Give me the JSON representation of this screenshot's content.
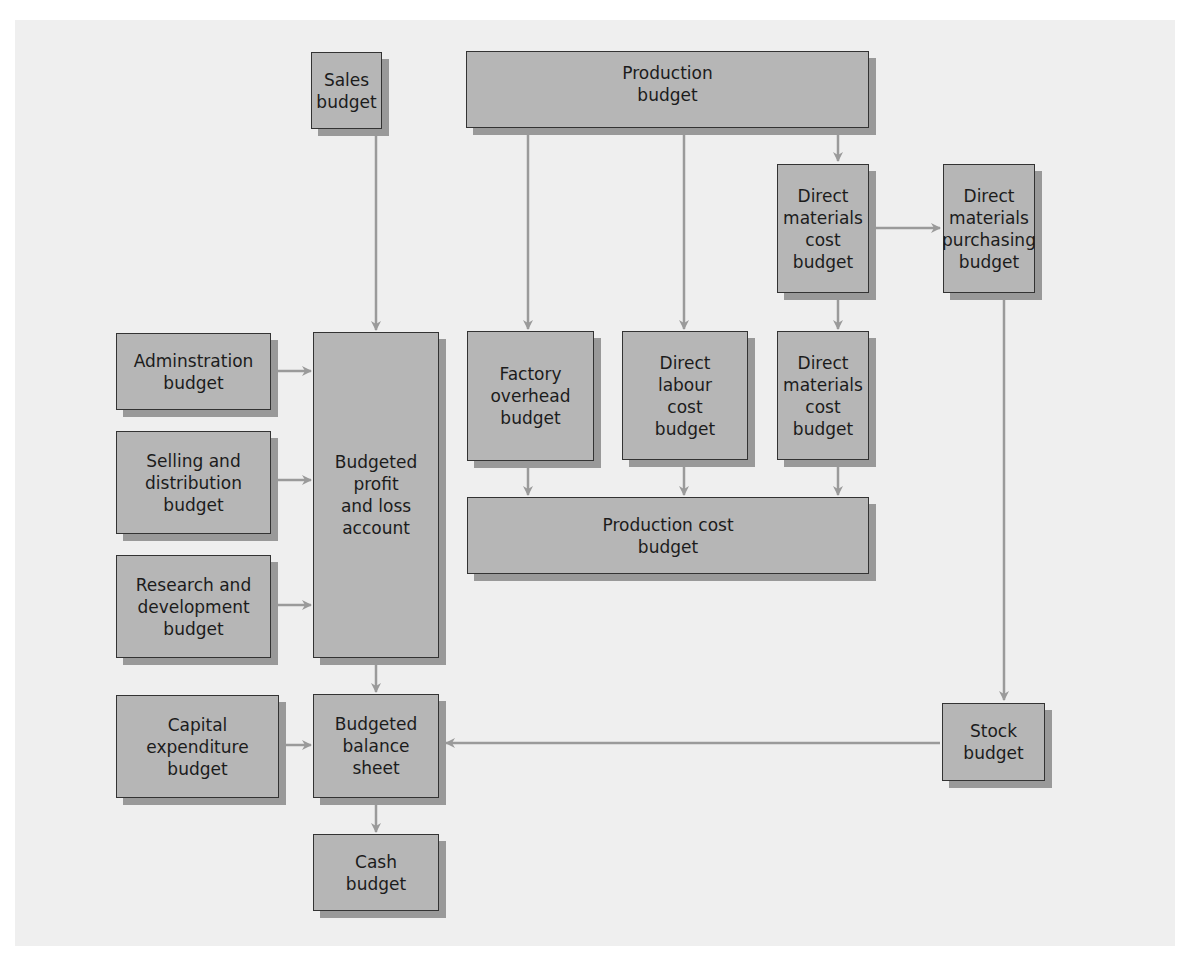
{
  "diagram": {
    "type": "flowchart",
    "nodes": {
      "sales": {
        "label": "Sales\nbudget"
      },
      "production": {
        "label": "Production\nbudget"
      },
      "dm_cost_top": {
        "label": "Direct\nmaterials\ncost\nbudget"
      },
      "dm_purchasing": {
        "label": "Direct\nmaterials\npurchasing\nbudget"
      },
      "administration": {
        "label": "Adminstration\nbudget"
      },
      "selling": {
        "label": "Selling and\ndistribution\nbudget"
      },
      "research": {
        "label": "Research and\ndevelopment\nbudget"
      },
      "profit_loss": {
        "label": "Budgeted\nprofit\nand loss\naccount"
      },
      "factory_overhead": {
        "label": "Factory\noverhead\nbudget"
      },
      "direct_labour": {
        "label": "Direct\nlabour\ncost\nbudget"
      },
      "dm_cost_mid": {
        "label": "Direct\nmaterials\ncost\nbudget"
      },
      "production_cost": {
        "label": "Production cost\nbudget"
      },
      "capital": {
        "label": "Capital\nexpenditure\nbudget"
      },
      "balance_sheet": {
        "label": "Budgeted\nbalance\nsheet"
      },
      "cash": {
        "label": "Cash\nbudget"
      },
      "stock": {
        "label": "Stock\nbudget"
      }
    },
    "edges": [
      [
        "sales",
        "profit_loss"
      ],
      [
        "production",
        "factory_overhead"
      ],
      [
        "production",
        "direct_labour"
      ],
      [
        "production",
        "dm_cost_top"
      ],
      [
        "dm_cost_top",
        "dm_purchasing"
      ],
      [
        "dm_cost_top",
        "dm_cost_mid"
      ],
      [
        "dm_purchasing",
        "stock"
      ],
      [
        "administration",
        "profit_loss"
      ],
      [
        "selling",
        "profit_loss"
      ],
      [
        "research",
        "profit_loss"
      ],
      [
        "factory_overhead",
        "production_cost"
      ],
      [
        "direct_labour",
        "production_cost"
      ],
      [
        "dm_cost_mid",
        "production_cost"
      ],
      [
        "profit_loss",
        "balance_sheet"
      ],
      [
        "capital",
        "balance_sheet"
      ],
      [
        "stock",
        "balance_sheet"
      ],
      [
        "balance_sheet",
        "cash"
      ]
    ],
    "colors": {
      "box_fill": "#b6b6b6",
      "box_border": "#333333",
      "shadow": "#999999",
      "arrow": "#9a9a9a",
      "background": "#efefef"
    }
  }
}
